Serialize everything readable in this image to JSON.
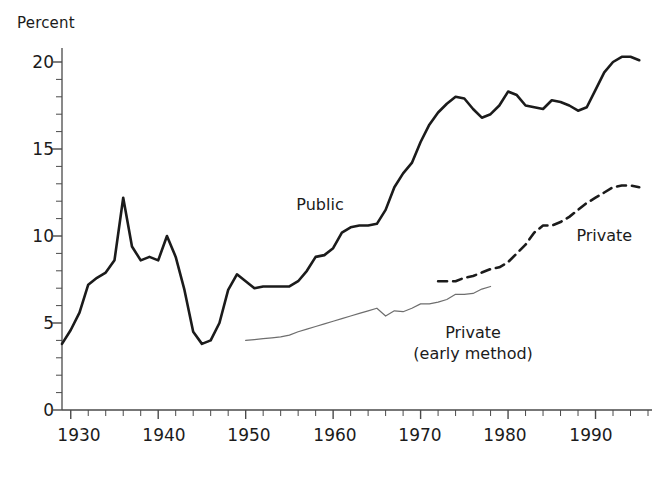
{
  "chart_data": {
    "type": "line",
    "title": "",
    "xlabel": "",
    "ylabel": "Percent",
    "xlim": [
      1929,
      1996
    ],
    "ylim": [
      0,
      21
    ],
    "grid": false,
    "legend_position": "inline-annotations",
    "y_ticks_major": [
      0,
      5,
      10,
      15,
      20
    ],
    "y_tick_minor_step": 1,
    "x_ticks_major": [
      1930,
      1940,
      1950,
      1960,
      1970,
      1980,
      1990
    ],
    "x_tick_minor_step": 2,
    "series": [
      {
        "name": "Public",
        "style": "solid",
        "color": "#1b1b1b",
        "width": 2.6,
        "label_text": "Public",
        "x": [
          1929,
          1930,
          1931,
          1932,
          1933,
          1934,
          1935,
          1936,
          1937,
          1938,
          1939,
          1940,
          1941,
          1942,
          1943,
          1944,
          1945,
          1946,
          1947,
          1948,
          1949,
          1950,
          1951,
          1952,
          1953,
          1954,
          1955,
          1956,
          1957,
          1958,
          1959,
          1960,
          1961,
          1962,
          1963,
          1964,
          1965,
          1966,
          1967,
          1968,
          1969,
          1970,
          1971,
          1972,
          1973,
          1974,
          1975,
          1976,
          1977,
          1978,
          1979,
          1980,
          1981,
          1982,
          1983,
          1984,
          1985,
          1986,
          1987,
          1988,
          1989,
          1990,
          1991,
          1992,
          1993,
          1994,
          1995
        ],
        "values": [
          3.8,
          4.6,
          5.6,
          7.2,
          7.6,
          7.9,
          8.6,
          12.2,
          9.4,
          8.6,
          8.8,
          8.6,
          10.0,
          8.8,
          6.9,
          4.5,
          3.8,
          4.0,
          5.0,
          6.9,
          7.8,
          7.4,
          7.0,
          7.1,
          7.1,
          7.1,
          7.1,
          7.4,
          8.0,
          8.8,
          8.9,
          9.3,
          10.2,
          10.5,
          10.6,
          10.6,
          10.7,
          11.5,
          12.8,
          13.6,
          14.2,
          15.4,
          16.4,
          17.1,
          17.6,
          18.0,
          17.9,
          17.3,
          16.8,
          17.0,
          17.5,
          18.3,
          18.1,
          17.5,
          17.4,
          17.3,
          17.8,
          17.7,
          17.5,
          17.2,
          17.4,
          18.4,
          19.4,
          20.0,
          20.3,
          20.3,
          20.1
        ]
      },
      {
        "name": "Private",
        "style": "dashed",
        "color": "#1b1b1b",
        "width": 2.6,
        "label_text": "Private",
        "x": [
          1972,
          1973,
          1974,
          1975,
          1976,
          1977,
          1978,
          1979,
          1980,
          1981,
          1982,
          1983,
          1984,
          1985,
          1986,
          1987,
          1988,
          1989,
          1990,
          1991,
          1992,
          1993,
          1994,
          1995
        ],
        "values": [
          7.4,
          7.4,
          7.4,
          7.6,
          7.7,
          7.9,
          8.1,
          8.2,
          8.5,
          9.0,
          9.5,
          10.2,
          10.6,
          10.6,
          10.8,
          11.1,
          11.5,
          11.9,
          12.2,
          12.5,
          12.8,
          12.9,
          12.9,
          12.8
        ]
      },
      {
        "name": "Private (early method)",
        "style": "solid-thin",
        "color": "#6e6e6e",
        "width": 1.2,
        "label_text_line1": "Private",
        "label_text_line2": "(early method)",
        "x": [
          1950,
          1951,
          1952,
          1953,
          1954,
          1955,
          1956,
          1957,
          1958,
          1959,
          1960,
          1961,
          1962,
          1963,
          1964,
          1965,
          1966,
          1967,
          1968,
          1969,
          1970,
          1971,
          1972,
          1973,
          1974,
          1975,
          1976,
          1977,
          1978
        ],
        "values": [
          4.0,
          4.05,
          4.1,
          4.15,
          4.2,
          4.3,
          4.5,
          4.65,
          4.8,
          4.95,
          5.1,
          5.25,
          5.4,
          5.55,
          5.7,
          5.85,
          5.4,
          5.7,
          5.65,
          5.85,
          6.1,
          6.1,
          6.2,
          6.35,
          6.65,
          6.65,
          6.7,
          6.95,
          7.1
        ]
      }
    ],
    "annotations": [
      {
        "text": "Public",
        "x": 1958.5,
        "y": 11.8
      },
      {
        "text": "Private",
        "x": 1991.0,
        "y": 10.0
      },
      {
        "text": "Private",
        "x": 1976.0,
        "y": 4.3
      },
      {
        "text": "(early method)",
        "x": 1976.0,
        "y": 3.2
      }
    ]
  },
  "axes": {
    "y_title": "Percent",
    "y_tick_labels": [
      "20",
      "15",
      "10",
      "5",
      "0"
    ],
    "x_tick_labels": [
      "1930",
      "1940",
      "1950",
      "1960",
      "1970",
      "1980",
      "1990"
    ]
  },
  "labels": {
    "public": "Public",
    "private": "Private",
    "private_early_1": "Private",
    "private_early_2": "(early method)"
  },
  "colors": {
    "public_line": "#1b1b1b",
    "private_line": "#1b1b1b",
    "private_early_line": "#6e6e6e",
    "axis": "#4a4a4a",
    "background": "#ffffff",
    "text": "#1b1b1b"
  }
}
